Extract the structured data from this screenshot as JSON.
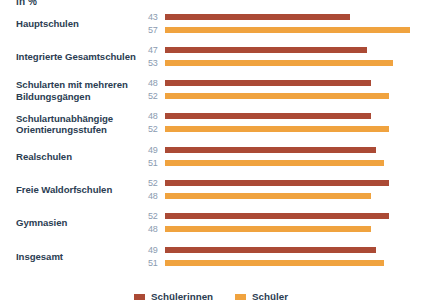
{
  "axis_unit": "in %",
  "legend": {
    "items": [
      {
        "label": "Schülerinnen",
        "color": "#ab4a35",
        "key": "female"
      },
      {
        "label": "Schüler",
        "color": "#f0a33f",
        "key": "male"
      }
    ]
  },
  "chart_data": {
    "type": "bar",
    "orientation": "horizontal",
    "title": "",
    "subtitle": "",
    "xlabel": "in %",
    "ylabel": "",
    "xlim": [
      0,
      60
    ],
    "grid": false,
    "legend_position": "bottom-center",
    "categories": [
      "Hauptschulen",
      "Integrierte Gesamtschulen",
      "Schularten mit mehreren Bildungsgängen",
      "Schulartunabhängige Orientierungsstufen",
      "Realschulen",
      "Freie Waldorfschulen",
      "Gymnasien",
      "Insgesamt"
    ],
    "series": [
      {
        "name": "Schülerinnen",
        "color": "#ab4a35",
        "values": [
          43,
          47,
          48,
          48,
          49,
          52,
          52,
          49
        ]
      },
      {
        "name": "Schüler",
        "color": "#f0a33f",
        "values": [
          57,
          53,
          52,
          52,
          51,
          48,
          48,
          51
        ]
      }
    ],
    "emphasis_category": "Insgesamt"
  }
}
